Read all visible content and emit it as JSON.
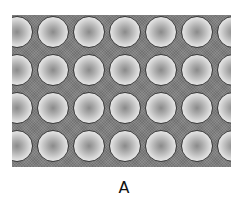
{
  "figure": {
    "caption": "A",
    "colors": {
      "background": "#ffffff",
      "matrix": "#7e7e7e",
      "sphere_center": "#8a8a8a",
      "sphere_edge": "#ffffff",
      "sphere_outline": "#3a3a3a"
    },
    "grid": {
      "rows": 4,
      "columns_visible": 7,
      "pitch_x_px": 36,
      "pitch_y_px": 38,
      "sphere_diameter_px": 32,
      "row_centers_y_px": [
        17,
        55,
        93,
        131
      ],
      "col_centers_x_px": [
        5,
        41,
        77,
        113,
        149,
        185,
        221
      ]
    }
  }
}
